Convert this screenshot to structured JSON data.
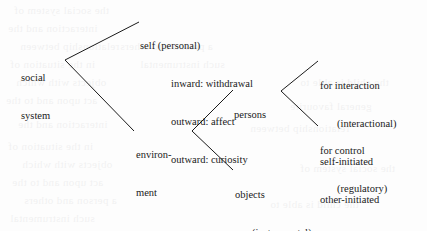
{
  "diagram": {
    "type": "tree-diagram",
    "ink_color": "#1a1a1a",
    "background_color": "#fdfdfd",
    "nodes": {
      "root": {
        "line1": "social",
        "line2": "system"
      },
      "self": {
        "label": "self (personal)",
        "children": [
          "inward: withdrawal",
          "outward: affect",
          "outward: curiosity"
        ]
      },
      "environment": {
        "line1": "environ-",
        "line2": "ment"
      },
      "persons": {
        "label": "persons"
      },
      "interaction": {
        "label": "for interaction",
        "paren": "(interactional)",
        "children": [
          "self-initiated",
          "other-initiated"
        ]
      },
      "control": {
        "label": "for control",
        "paren": "(regulatory)"
      },
      "objects": {
        "label": "objects",
        "paren": "(instrumental)",
        "children": [
          "general",
          "favourite"
        ]
      }
    }
  },
  "bleed_text": {
    "l1": "the social system of",
    "l2": "interaction and the",
    "l3": "relationship between",
    "l4": "a person and others",
    "l5": "in the situation of",
    "l6": "such instrumental",
    "l7": "objects with which",
    "l8": "the child is able to",
    "l9": "act upon and to the",
    "l10": "general favourite"
  }
}
